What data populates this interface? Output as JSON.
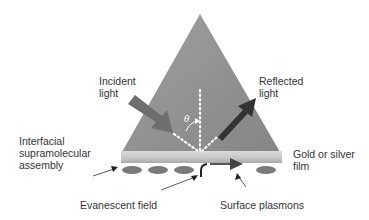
{
  "diagram": {
    "labels": {
      "incident_light": "Incident\nlight",
      "reflected_light": "Reflected\nlight",
      "interfacial_assembly": "Interfacial\nsupramolecular\nassembly",
      "gold_silver_film": "Gold or silver\nfilm",
      "evanescent_field": "Evanescent field",
      "surface_plasmons": "Surface plasmons",
      "angle_symbol": "θ"
    },
    "colors": {
      "prism": "#8c8c8c",
      "film": "#cfcfcf",
      "film_dark": "#a8a8a8",
      "ellipse": "#7a7a7a",
      "incident_arrow": "#6e6e6e",
      "reflected_arrow": "#3a3a3a",
      "dotted_line": "#ffffff",
      "text": "#333333"
    }
  }
}
